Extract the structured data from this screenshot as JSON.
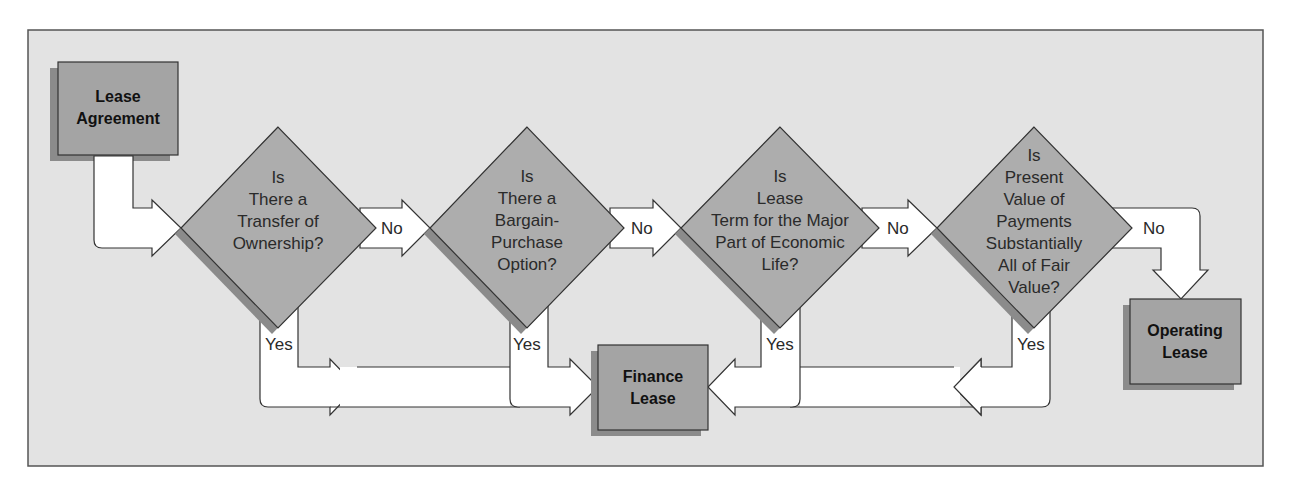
{
  "diagram": {
    "type": "flowchart",
    "colors": {
      "background": "#e3e3e3",
      "frame_border": "#555555",
      "box_fill": "#a4a4a4",
      "diamond_fill": "#adadad",
      "shadow": "#8b8b8b",
      "arrow_fill": "#ffffff",
      "stroke": "#333333"
    },
    "start": {
      "label_line1": "Lease",
      "label_line2": "Agreement"
    },
    "decisions": [
      {
        "lines": [
          "Is",
          "There a",
          "Transfer of",
          "Ownership?"
        ]
      },
      {
        "lines": [
          "Is",
          "There a",
          "Bargain-",
          "Purchase",
          "Option?"
        ]
      },
      {
        "lines": [
          "Is",
          "Lease",
          "Term for the Major",
          "Part of Economic",
          "Life?"
        ]
      },
      {
        "lines": [
          "Is",
          "Present",
          "Value of",
          "Payments",
          "Substantially",
          "All of Fair",
          "Value?"
        ]
      }
    ],
    "edges": {
      "no": [
        "No",
        "No",
        "No",
        "No"
      ],
      "yes": [
        "Yes",
        "Yes",
        "Yes",
        "Yes"
      ]
    },
    "outcomes": {
      "finance": {
        "label_line1": "Finance",
        "label_line2": "Lease"
      },
      "operating": {
        "label_line1": "Operating",
        "label_line2": "Lease"
      }
    }
  }
}
